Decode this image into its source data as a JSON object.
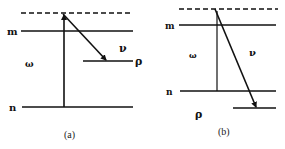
{
  "diagram": {
    "type": "energy-level diagram",
    "panels": [
      {
        "id": "a",
        "caption": "(a)",
        "levels": {
          "virtual": "dashed",
          "m": "m",
          "n": "n",
          "rho": "ρ"
        },
        "labels": {
          "omega": "ω",
          "nu": "ν",
          "m": "m",
          "n": "n",
          "rho": "ρ"
        },
        "transitions": [
          {
            "name": "excitation",
            "from": "n",
            "to": "virtual",
            "label": "ω"
          },
          {
            "name": "emission",
            "from": "virtual",
            "to": "ρ",
            "label": "ν"
          }
        ]
      },
      {
        "id": "b",
        "caption": "(b)",
        "labels": {
          "omega": "ω",
          "nu": "ν",
          "m": "m",
          "n": "n",
          "rho": "ρ"
        },
        "transitions": [
          {
            "name": "excitation",
            "from": "n",
            "to": "virtual",
            "label": "ω"
          },
          {
            "name": "emission",
            "from": "virtual",
            "to": "ρ (below n)",
            "label": "ν"
          }
        ]
      }
    ]
  },
  "colors": {
    "line": "#111111",
    "background": "#ffffff"
  }
}
